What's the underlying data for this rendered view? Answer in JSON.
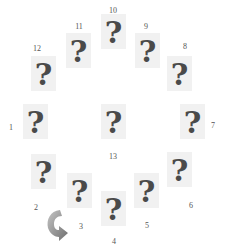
{
  "game": {
    "layout": "clock",
    "card_face": "?",
    "colors": {
      "card_bg": "#f1f1f1",
      "glyph": "#4a4a4a",
      "label": "#555555",
      "arrow": "#8a8a8a"
    }
  },
  "positions": [
    {
      "id": "1",
      "label": "1"
    },
    {
      "id": "2",
      "label": "2"
    },
    {
      "id": "3",
      "label": "3"
    },
    {
      "id": "4",
      "label": "4"
    },
    {
      "id": "5",
      "label": "5"
    },
    {
      "id": "6",
      "label": "6"
    },
    {
      "id": "7",
      "label": "7"
    },
    {
      "id": "8",
      "label": "8"
    },
    {
      "id": "9",
      "label": "9"
    },
    {
      "id": "10",
      "label": "10"
    },
    {
      "id": "11",
      "label": "11"
    },
    {
      "id": "12",
      "label": "12"
    },
    {
      "id": "13",
      "label": "13"
    }
  ],
  "controls": {
    "rotate_arrow": "rotate-icon"
  }
}
